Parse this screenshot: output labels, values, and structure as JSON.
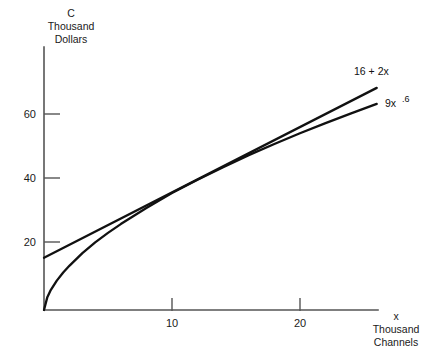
{
  "chart_data": {
    "type": "line",
    "title": "",
    "subtitle": "",
    "xlabel_lines": [
      "x",
      "Thousand",
      "Channels"
    ],
    "ylabel_lines": [
      "C",
      "Thousand",
      "Dollars"
    ],
    "xlabel": "x Thousand Channels",
    "ylabel": "C Thousand Dollars",
    "xlim": [
      0,
      26
    ],
    "ylim": [
      0,
      72
    ],
    "xticks": [
      10,
      20
    ],
    "yticks": [
      20,
      40,
      60
    ],
    "xtick_labels": [
      "10",
      "20"
    ],
    "ytick_labels": [
      "20",
      "40",
      "60"
    ],
    "grid": false,
    "legend_position": "inline-right",
    "line_color": "#111111",
    "axis_color": "#555555",
    "background_color": "#ffffff",
    "series": [
      {
        "name": "16 + 2x",
        "label_text": "16 + 2x",
        "label_base": "16 + 2x",
        "label_sup": "",
        "formula": "C = 16 + 2x",
        "x": [
          0,
          1,
          2,
          3,
          4,
          5,
          6,
          7,
          8,
          9,
          10,
          11,
          12,
          13,
          14,
          15,
          16,
          17,
          18,
          19,
          20,
          21,
          22,
          23,
          24,
          25,
          26
        ],
        "values": [
          16,
          18,
          20,
          22,
          24,
          26,
          28,
          30,
          32,
          34,
          36,
          38,
          40,
          42,
          44,
          46,
          48,
          50,
          52,
          54,
          56,
          58,
          60,
          62,
          64,
          66,
          68
        ]
      },
      {
        "name": "9x^.6",
        "label_text": "9x .6",
        "label_base": "9x",
        "label_sup": ".6",
        "formula": "C = 9x^0.6",
        "x": [
          0,
          0.25,
          0.5,
          1,
          1.5,
          2,
          3,
          4,
          5,
          6,
          7,
          8,
          9,
          10,
          12,
          14,
          16,
          18,
          20,
          22,
          24,
          26
        ],
        "values": [
          0,
          3.8,
          5.9,
          9.0,
          11.5,
          13.6,
          17.4,
          20.7,
          23.6,
          26.3,
          28.8,
          31.2,
          33.5,
          35.8,
          39.9,
          43.7,
          47.4,
          50.8,
          54.1,
          57.2,
          60.2,
          63.1
        ]
      }
    ]
  },
  "axes": {
    "y_axis_title": {
      "line1": "C",
      "line2": "Thousand",
      "line3": "Dollars"
    },
    "x_axis_title": {
      "line1": "x",
      "line2": "Thousand",
      "line3": "Channels"
    }
  },
  "labels": {
    "linear_curve": "16 + 2x",
    "power_curve_base": "9x",
    "power_curve_exponent": ".6",
    "ytick_20": "20",
    "ytick_40": "40",
    "ytick_60": "60",
    "xtick_10": "10",
    "xtick_20": "20"
  }
}
